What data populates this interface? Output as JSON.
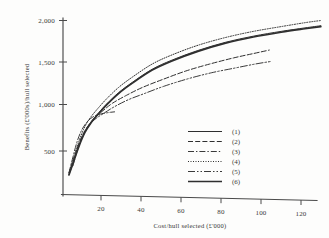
{
  "chart_data": {
    "type": "line",
    "title": "",
    "xlabel": "Cost/hull selected (£'000)",
    "ylabel": "Benefits (£'000s)/hull selected",
    "xlim": [
      0,
      132
    ],
    "ylim": [
      0,
      2150
    ],
    "xticks": [
      20,
      40,
      60,
      80,
      100,
      120
    ],
    "xticklabels": [
      "20",
      "40",
      "60",
      "80",
      "100",
      "120"
    ],
    "yticks": [
      500,
      1000,
      1500,
      2000
    ],
    "yticklabels": [
      "500",
      "1,000",
      "1,500",
      "2,000"
    ],
    "grid": false,
    "legend_position": "center-right",
    "series": [
      {
        "name": "(1)",
        "style": "solid",
        "x": [
          3,
          5,
          8,
          11,
          14,
          18,
          22,
          28,
          35,
          45,
          55,
          68,
          82,
          96,
          110,
          122,
          130
        ],
        "y": [
          230,
          360,
          560,
          720,
          830,
          940,
          1040,
          1170,
          1290,
          1440,
          1545,
          1655,
          1750,
          1820,
          1875,
          1915,
          1940
        ]
      },
      {
        "name": "(2)",
        "style": "dashed",
        "x": [
          4,
          7,
          10,
          13,
          16,
          20,
          25,
          32,
          40,
          50,
          62,
          74,
          86,
          96,
          104
        ],
        "y": [
          300,
          520,
          690,
          800,
          880,
          960,
          1050,
          1140,
          1230,
          1320,
          1420,
          1500,
          1570,
          1620,
          1660
        ]
      },
      {
        "name": "(3)",
        "style": "dashdot",
        "x": [
          3,
          5,
          7,
          9,
          11,
          13,
          15,
          18,
          21,
          24,
          26
        ],
        "y": [
          250,
          430,
          600,
          720,
          800,
          855,
          890,
          920,
          935,
          945,
          950
        ]
      },
      {
        "name": "(4)",
        "style": "dotted",
        "x": [
          3,
          5,
          8,
          11,
          14,
          18,
          22,
          28,
          35,
          45,
          55,
          68,
          82,
          96,
          110,
          122,
          130
        ],
        "y": [
          250,
          400,
          610,
          780,
          890,
          1000,
          1100,
          1230,
          1350,
          1500,
          1605,
          1715,
          1805,
          1875,
          1930,
          1975,
          2000
        ]
      },
      {
        "name": "(5)",
        "style": "longdash",
        "x": [
          5,
          8,
          11,
          14,
          17,
          21,
          26,
          33,
          41,
          51,
          63,
          75,
          87,
          97,
          105
        ],
        "y": [
          330,
          560,
          720,
          820,
          880,
          940,
          1010,
          1090,
          1160,
          1245,
          1330,
          1400,
          1455,
          1500,
          1530
        ]
      },
      {
        "name": "(6)",
        "style": "thick-solid",
        "x": [
          3,
          5,
          8,
          11,
          14,
          18,
          22,
          28,
          35,
          45,
          55,
          68,
          82,
          96,
          110,
          122,
          130
        ],
        "y": [
          225,
          355,
          550,
          710,
          820,
          930,
          1030,
          1160,
          1280,
          1430,
          1535,
          1645,
          1740,
          1810,
          1865,
          1905,
          1930
        ]
      }
    ]
  },
  "axes": {
    "y_title": "Benefits (£'000s)/hull selected",
    "x_title": "Cost/hull selected (£'000)",
    "y_tick_labels": [
      "2,000",
      "1,500",
      "1,000",
      "500"
    ],
    "x_tick_labels": [
      "20",
      "40",
      "60",
      "80",
      "100",
      "120"
    ]
  },
  "legend": {
    "items": [
      {
        "label": "(1)",
        "style": "solid"
      },
      {
        "label": "(2)",
        "style": "dashed"
      },
      {
        "label": "(3)",
        "style": "dashdot"
      },
      {
        "label": "(4)",
        "style": "dotted"
      },
      {
        "label": "(5)",
        "style": "longdash"
      },
      {
        "label": "(6)",
        "style": "thick-solid"
      }
    ]
  },
  "colors": {
    "ink": "#2f2f2f",
    "axis": "#4a4a4a",
    "background": "#fdfdfc"
  }
}
